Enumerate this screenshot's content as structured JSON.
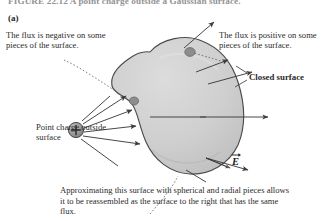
{
  "figure": {
    "caption_top": "FIGURE 22.12  A point charge outside a Gaussian surface.",
    "panel_label": "(a)",
    "caption_bottom": "Approximating this surface with spherical and radial pieces allows it to be reassembled as the surface to the right that has the same flux."
  },
  "annotations": {
    "flux_negative": "The flux is negative on some pieces of the surface.",
    "flux_positive": "The flux is positive on some pieces of the surface.",
    "closed_surface": "Closed surface",
    "point_charge": "Point charge outside surface",
    "field_label": "E"
  },
  "icons": {
    "charge": "positive-point-charge-icon",
    "field_arrow": "electric-field-arrow-icon",
    "vector_accent": "vector-arrow-accent-icon"
  },
  "colors": {
    "surface_fill": "#c9c9c9",
    "surface_fill_light": "#d8d8d8",
    "surface_stroke": "#4a4a4a",
    "patch_dark": "#8a8a8a",
    "charge_fill": "#9a9a9a",
    "charge_stroke": "#3a3a3a",
    "arrow": "#3d3d3d",
    "leader": "#6e6e6e",
    "text": "#2b2b2b",
    "background": "#ffffff"
  }
}
